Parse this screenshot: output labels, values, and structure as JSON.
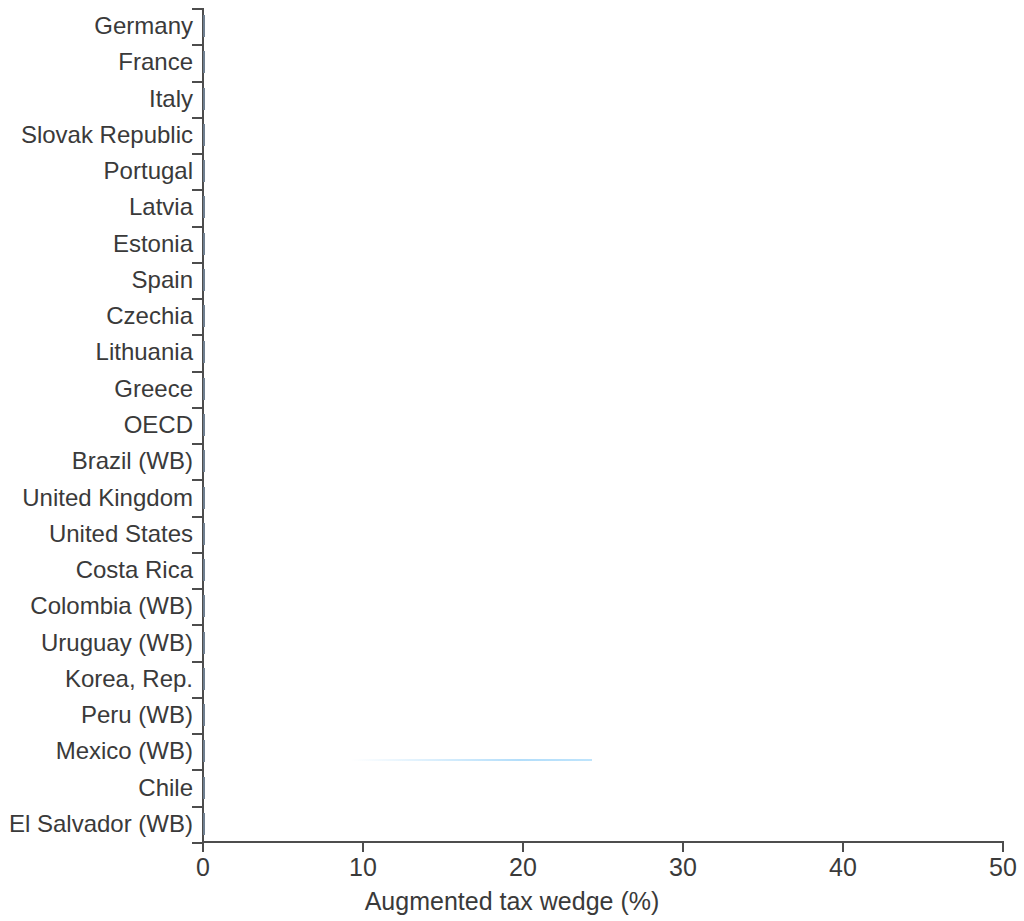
{
  "chart_data": {
    "type": "bar",
    "orientation": "horizontal",
    "title": "",
    "xlabel": "Augmented tax wedge (%)",
    "ylabel": "",
    "xlim": [
      0,
      50
    ],
    "xticks": [
      0,
      10,
      20,
      30,
      40,
      50
    ],
    "xtick_labels": [
      "0",
      "10",
      "20",
      "30",
      "40",
      "50"
    ],
    "grid": false,
    "legend": null,
    "bar_color": "#3d8bd8",
    "bar_edge_color": "#6f7f90",
    "categories": [
      "Germany",
      "France",
      "Italy",
      "Slovak Republic",
      "Portugal",
      "Latvia",
      "Estonia",
      "Spain",
      "Czechia",
      "Lithuania",
      "Greece",
      "OECD",
      "Brazil (WB)",
      "United Kingdom",
      "United States",
      "Costa Rica",
      "Colombia (WB)",
      "Uruguay (WB)",
      "Korea, Rep.",
      "Peru (WB)",
      "Mexico (WB)",
      "Chile",
      "El Salvador (WB)"
    ],
    "values": [
      47.9,
      46.8,
      45.3,
      44.3,
      42.4,
      41.2,
      40.6,
      40.3,
      40.3,
      39.1,
      38.6,
      38.0,
      31.4,
      31.4,
      30.0,
      28.6,
      27.4,
      26.8,
      24.6,
      24.3,
      24.3,
      22.6,
      20.3
    ]
  }
}
